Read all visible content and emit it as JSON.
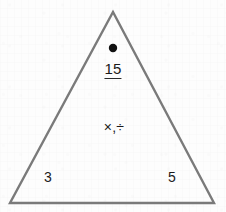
{
  "figure": {
    "type": "fact-family-triangle",
    "stroke_color": "#7a7a7a",
    "ink_color": "#1b1b1b",
    "background_color": "#fdfdfd",
    "triangle": {
      "apex": {
        "x": 113,
        "y": 12
      },
      "bottom_left": {
        "x": 10,
        "y": 203
      },
      "bottom_right": {
        "x": 214,
        "y": 203
      },
      "stroke_width": 2.4
    },
    "marker_dot": {
      "name": "apex-dot",
      "cx": 113,
      "cy": 48,
      "r": 4.2,
      "color": "#111111"
    },
    "product": {
      "value": "15",
      "underlined": true,
      "x": 113,
      "y": 70
    },
    "operators": {
      "value": "×,÷",
      "x": 114,
      "y": 127
    },
    "factors": [
      {
        "name": "left-factor",
        "value": "3",
        "x": 48,
        "y": 177
      },
      {
        "name": "right-factor",
        "value": "5",
        "x": 172,
        "y": 177
      }
    ]
  }
}
